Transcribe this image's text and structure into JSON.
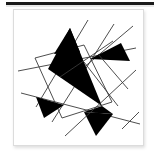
{
  "window": {
    "title": "Abstract Geometric Artwork",
    "top_bar_color": "#1b1b1b",
    "card_background": "#ffffff",
    "card_border_color": "#dcdcdc"
  },
  "artwork": {
    "name": "Constructivist Triangles and Lines",
    "caption": "",
    "background_color": "#ffffff",
    "ink_color": "#000000",
    "line_color": "#3a3a3a",
    "viewbox": "0 0 122 128",
    "filled_shapes": [
      {
        "id": "big-central-triangle",
        "name": "large-black-triangle",
        "points": "52,14 30,55 84,92",
        "fill": "#000000"
      },
      {
        "id": "upper-wing-triangle",
        "name": "upper-black-wedge",
        "points": "52,14 62,38 36,40",
        "fill": "#000000"
      },
      {
        "id": "right-pointing-triangle",
        "name": "right-black-arrow-triangle",
        "points": "103,29 112,47 72,45",
        "fill": "#000000"
      },
      {
        "id": "left-small-triangle",
        "name": "left-black-triangle",
        "points": "18,83 46,91 26,104",
        "fill": "#000000"
      },
      {
        "id": "bottom-triangle",
        "name": "bottom-black-triangle",
        "points": "66,98 95,100 78,122",
        "fill": "#000000"
      },
      {
        "id": "lower-right-fill",
        "name": "lower-right-black-wedge",
        "points": "84,92 95,100 66,98",
        "fill": "#000000"
      }
    ],
    "quadrilateral": {
      "id": "outlined-quad",
      "name": "outlined-quadrilateral",
      "points": "17,44 66,31 94,88 44,104",
      "stroke": "#3a3a3a",
      "stroke_width": 0.9,
      "fill": "none"
    },
    "lines": [
      {
        "id": "line-1",
        "name": "diagonal-line-1",
        "x1": 70,
        "y1": 6,
        "x2": 18,
        "y2": 93
      },
      {
        "id": "line-2",
        "name": "diagonal-line-2",
        "x1": 96,
        "y1": 10,
        "x2": 34,
        "y2": 108
      },
      {
        "id": "line-3",
        "name": "diagonal-line-3",
        "x1": 115,
        "y1": 12,
        "x2": 58,
        "y2": 60
      },
      {
        "id": "line-4",
        "name": "diagonal-line-4",
        "x1": 3,
        "y1": 79,
        "x2": 122,
        "y2": 110
      },
      {
        "id": "line-5",
        "name": "diagonal-line-5",
        "x1": 0,
        "y1": 57,
        "x2": 118,
        "y2": 34
      },
      {
        "id": "line-6",
        "name": "diagonal-line-6",
        "x1": 118,
        "y1": 56,
        "x2": 47,
        "y2": 122
      },
      {
        "id": "line-7",
        "name": "diagonal-line-7",
        "x1": 104,
        "y1": 115,
        "x2": 121,
        "y2": 98
      },
      {
        "id": "line-8",
        "name": "diagonal-line-8",
        "x1": 42,
        "y1": 63,
        "x2": 95,
        "y2": 27
      },
      {
        "id": "line-9",
        "name": "diagonal-line-9",
        "x1": 66,
        "y1": 48,
        "x2": 100,
        "y2": 92
      },
      {
        "id": "line-10",
        "name": "diagonal-line-10",
        "x1": 80,
        "y1": 40,
        "x2": 110,
        "y2": 75
      }
    ]
  }
}
